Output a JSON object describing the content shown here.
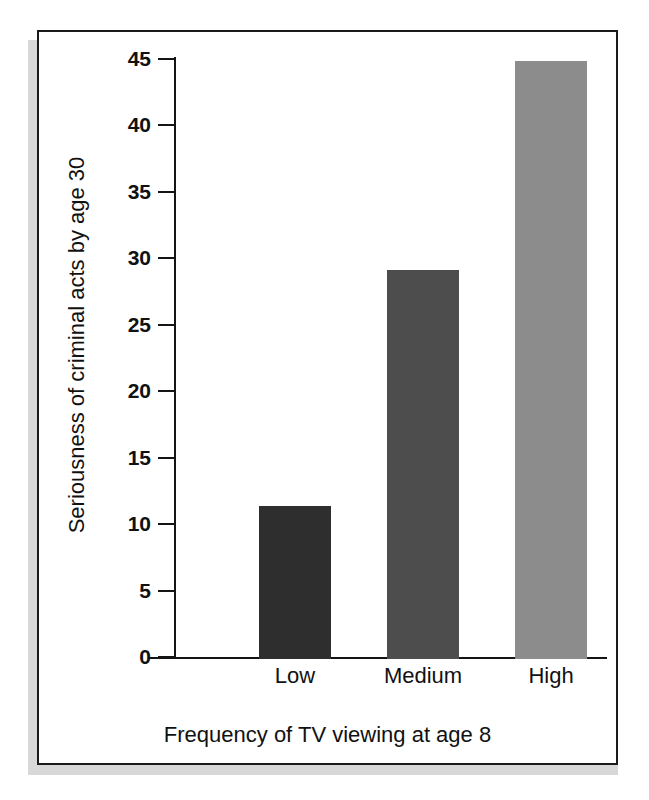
{
  "figure": {
    "background_color": "#ffffff",
    "frame_color": "#1a1a1a",
    "shadow_color": "#d8d8d8"
  },
  "chart_data": {
    "type": "bar",
    "title": "",
    "subtitle": "",
    "categories": [
      "Low",
      "Medium",
      "High"
    ],
    "values": [
      11.5,
      29.3,
      45.0
    ],
    "xlabel": "Frequency of TV viewing at age 8",
    "ylabel": "Seriousness of criminal acts by age 30",
    "ylim": [
      0,
      45
    ],
    "xlim_categories": 3,
    "yticks": [
      0,
      5,
      10,
      15,
      20,
      25,
      30,
      35,
      40,
      45
    ],
    "ytick_labels": [
      "0",
      "5",
      "10",
      "15",
      "20",
      "25",
      "30",
      "35",
      "40",
      "45"
    ],
    "grid": false,
    "legend": false,
    "legend_position": "none",
    "bar_colors": [
      "#2e2e2e",
      "#4d4d4d",
      "#8c8c8c"
    ],
    "bars": [
      {
        "category": "Low",
        "value": 11.5,
        "color": "#2e2e2e"
      },
      {
        "category": "Medium",
        "value": 29.3,
        "color": "#4d4d4d"
      },
      {
        "category": "High",
        "value": 45.0,
        "color": "#8c8c8c"
      }
    ]
  }
}
